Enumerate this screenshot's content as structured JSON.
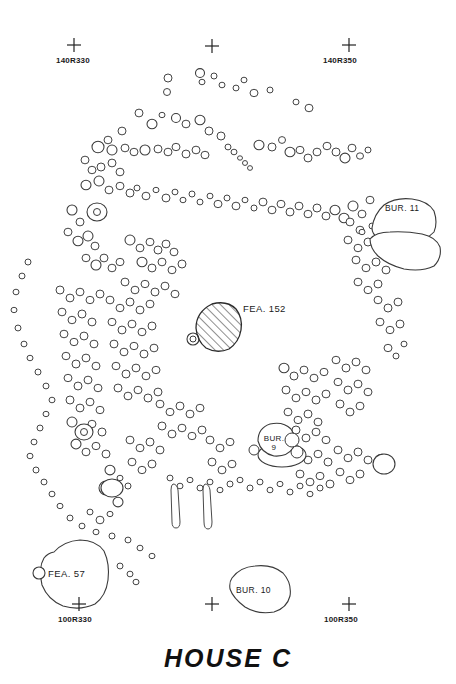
{
  "document": {
    "title": "HOUSE  C",
    "type": "archaeological-plan-map",
    "background_color": "#ffffff",
    "line_color": "#3a3a3a",
    "text_color": "#1a1a1a"
  },
  "grid_markers": [
    {
      "id": "gm-140r330",
      "label": "140R330",
      "x": 74,
      "y": 45,
      "labeled": true
    },
    {
      "id": "gm-140r340",
      "label": "",
      "x": 212,
      "y": 46,
      "labeled": false
    },
    {
      "id": "gm-140r350",
      "label": "140R350",
      "x": 349,
      "y": 45,
      "labeled": true
    },
    {
      "id": "gm-100r330",
      "label": "100R330",
      "x": 79,
      "y": 604,
      "labeled": true
    },
    {
      "id": "gm-100r340",
      "label": "",
      "x": 212,
      "y": 604,
      "labeled": false
    },
    {
      "id": "gm-100r350",
      "label": "100R350",
      "x": 349,
      "y": 604,
      "labeled": true
    }
  ],
  "features": [
    {
      "id": "fea-152",
      "label": "FEA. 152",
      "kind": "hearth-hatched",
      "label_x": 243,
      "label_y": 308
    },
    {
      "id": "bur-11",
      "label": "BUR. 11",
      "kind": "burial",
      "label_x": 385,
      "label_y": 208
    },
    {
      "id": "bur-9",
      "label": "BUR.",
      "label2": "9",
      "kind": "burial",
      "label_x": 262,
      "label_y": 438
    },
    {
      "id": "bur-10",
      "label": "BUR. 10",
      "kind": "burial",
      "label_x": 235,
      "label_y": 596
    },
    {
      "id": "fea-57",
      "label": "FEA. 57",
      "kind": "pit",
      "label_x": 48,
      "label_y": 573
    }
  ],
  "chart_data": {
    "type": "scatter",
    "title": "HOUSE  C",
    "xlabel": "",
    "ylabel": "",
    "postmolds": [
      [
        168,
        78,
        4
      ],
      [
        200,
        73,
        4.5
      ],
      [
        222,
        85,
        3
      ],
      [
        254,
        93,
        4
      ],
      [
        270,
        90,
        3
      ],
      [
        296,
        102,
        3
      ],
      [
        309,
        108,
        4
      ],
      [
        167,
        92,
        3.5
      ],
      [
        139,
        113,
        4
      ],
      [
        152,
        124,
        5
      ],
      [
        162,
        115,
        3
      ],
      [
        176,
        118,
        4.5
      ],
      [
        186,
        124,
        4
      ],
      [
        200,
        120,
        5
      ],
      [
        209,
        131,
        4
      ],
      [
        122,
        131,
        4
      ],
      [
        108,
        140,
        4
      ],
      [
        98,
        147,
        6
      ],
      [
        112,
        150,
        5
      ],
      [
        125,
        148,
        4
      ],
      [
        134,
        152,
        4
      ],
      [
        145,
        150,
        5
      ],
      [
        158,
        149,
        4
      ],
      [
        168,
        152,
        4
      ],
      [
        176,
        147,
        4
      ],
      [
        186,
        154,
        4
      ],
      [
        196,
        150,
        4
      ],
      [
        205,
        155,
        4
      ],
      [
        221,
        136,
        4
      ],
      [
        228,
        147,
        3
      ],
      [
        234,
        152,
        3
      ],
      [
        240,
        158,
        2.5
      ],
      [
        245,
        163,
        2.5
      ],
      [
        250,
        168,
        2.5
      ],
      [
        259,
        145,
        5
      ],
      [
        272,
        147,
        4
      ],
      [
        282,
        140,
        3.5
      ],
      [
        290,
        152,
        5
      ],
      [
        300,
        150,
        4
      ],
      [
        308,
        158,
        4
      ],
      [
        317,
        152,
        4
      ],
      [
        327,
        146,
        4
      ],
      [
        336,
        152,
        4
      ],
      [
        345,
        158,
        5
      ],
      [
        352,
        148,
        4
      ],
      [
        360,
        156,
        3.5
      ],
      [
        368,
        150,
        3
      ],
      [
        85,
        160,
        4
      ],
      [
        92,
        170,
        4
      ],
      [
        101,
        167,
        4
      ],
      [
        112,
        163,
        4
      ],
      [
        120,
        172,
        4
      ],
      [
        86,
        185,
        5
      ],
      [
        99,
        181,
        5
      ],
      [
        109,
        190,
        4
      ],
      [
        120,
        186,
        4
      ],
      [
        130,
        193,
        4
      ],
      [
        137,
        188,
        3
      ],
      [
        146,
        196,
        4
      ],
      [
        156,
        190,
        3
      ],
      [
        166,
        198,
        4
      ],
      [
        175,
        192,
        3
      ],
      [
        183,
        200,
        3
      ],
      [
        192,
        194,
        3
      ],
      [
        200,
        202,
        3
      ],
      [
        210,
        196,
        3
      ],
      [
        218,
        204,
        4
      ],
      [
        227,
        198,
        3
      ],
      [
        236,
        206,
        4
      ],
      [
        245,
        200,
        3
      ],
      [
        254,
        208,
        3
      ],
      [
        263,
        202,
        4
      ],
      [
        272,
        210,
        4
      ],
      [
        281,
        204,
        4
      ],
      [
        290,
        212,
        4
      ],
      [
        299,
        206,
        4
      ],
      [
        308,
        214,
        4
      ],
      [
        317,
        208,
        4
      ],
      [
        326,
        216,
        4
      ],
      [
        335,
        210,
        5
      ],
      [
        344,
        218,
        5
      ],
      [
        353,
        206,
        5
      ],
      [
        362,
        214,
        4
      ],
      [
        370,
        200,
        4
      ],
      [
        72,
        210,
        5
      ],
      [
        80,
        222,
        4
      ],
      [
        68,
        232,
        4
      ],
      [
        78,
        241,
        5
      ],
      [
        88,
        236,
        5
      ],
      [
        95,
        246,
        4
      ],
      [
        86,
        258,
        4
      ],
      [
        96,
        265,
        5
      ],
      [
        104,
        258,
        4
      ],
      [
        112,
        268,
        4
      ],
      [
        120,
        262,
        4
      ],
      [
        130,
        240,
        5
      ],
      [
        140,
        248,
        4
      ],
      [
        150,
        242,
        4
      ],
      [
        158,
        250,
        4
      ],
      [
        166,
        244,
        4
      ],
      [
        174,
        252,
        4
      ],
      [
        142,
        262,
        5
      ],
      [
        152,
        268,
        4
      ],
      [
        162,
        262,
        4
      ],
      [
        172,
        270,
        4
      ],
      [
        182,
        264,
        4
      ],
      [
        125,
        282,
        4
      ],
      [
        135,
        290,
        4
      ],
      [
        145,
        284,
        4
      ],
      [
        155,
        292,
        4
      ],
      [
        165,
        286,
        4
      ],
      [
        175,
        294,
        4
      ],
      [
        28,
        262,
        3
      ],
      [
        22,
        276,
        3
      ],
      [
        16,
        292,
        3
      ],
      [
        14,
        310,
        3
      ],
      [
        18,
        328,
        3
      ],
      [
        24,
        344,
        3
      ],
      [
        30,
        358,
        3
      ],
      [
        38,
        372,
        3
      ],
      [
        46,
        386,
        3
      ],
      [
        52,
        400,
        3
      ],
      [
        46,
        414,
        3
      ],
      [
        40,
        428,
        3
      ],
      [
        34,
        442,
        3
      ],
      [
        30,
        456,
        3
      ],
      [
        36,
        470,
        3
      ],
      [
        44,
        482,
        3
      ],
      [
        52,
        494,
        3
      ],
      [
        60,
        506,
        3
      ],
      [
        70,
        518,
        3
      ],
      [
        82,
        526,
        3
      ],
      [
        96,
        532,
        3
      ],
      [
        112,
        536,
        3
      ],
      [
        128,
        540,
        3
      ],
      [
        140,
        548,
        3
      ],
      [
        152,
        556,
        3
      ],
      [
        120,
        566,
        3
      ],
      [
        130,
        574,
        3
      ],
      [
        136,
        582,
        3
      ],
      [
        60,
        290,
        4
      ],
      [
        70,
        298,
        4
      ],
      [
        80,
        292,
        4
      ],
      [
        90,
        300,
        4
      ],
      [
        100,
        294,
        4
      ],
      [
        62,
        312,
        4
      ],
      [
        72,
        320,
        4
      ],
      [
        82,
        314,
        4
      ],
      [
        92,
        322,
        4
      ],
      [
        64,
        334,
        4
      ],
      [
        74,
        342,
        4
      ],
      [
        84,
        336,
        4
      ],
      [
        94,
        344,
        4
      ],
      [
        66,
        356,
        4
      ],
      [
        76,
        364,
        4
      ],
      [
        86,
        358,
        4
      ],
      [
        96,
        366,
        4
      ],
      [
        68,
        378,
        4
      ],
      [
        78,
        386,
        4
      ],
      [
        88,
        380,
        4
      ],
      [
        98,
        388,
        4
      ],
      [
        70,
        400,
        4
      ],
      [
        80,
        408,
        4
      ],
      [
        90,
        402,
        4
      ],
      [
        100,
        410,
        4
      ],
      [
        72,
        422,
        5
      ],
      [
        82,
        430,
        5
      ],
      [
        92,
        424,
        4
      ],
      [
        102,
        432,
        4
      ],
      [
        76,
        444,
        5
      ],
      [
        86,
        452,
        4
      ],
      [
        96,
        446,
        4
      ],
      [
        106,
        454,
        4
      ],
      [
        110,
        300,
        4
      ],
      [
        120,
        308,
        4
      ],
      [
        130,
        302,
        4
      ],
      [
        140,
        310,
        4
      ],
      [
        150,
        304,
        4
      ],
      [
        112,
        322,
        4
      ],
      [
        122,
        330,
        4
      ],
      [
        132,
        324,
        4
      ],
      [
        142,
        332,
        4
      ],
      [
        152,
        326,
        4
      ],
      [
        114,
        344,
        4
      ],
      [
        124,
        352,
        4
      ],
      [
        134,
        346,
        4
      ],
      [
        144,
        354,
        4
      ],
      [
        154,
        348,
        4
      ],
      [
        116,
        366,
        4
      ],
      [
        126,
        374,
        4
      ],
      [
        136,
        368,
        4
      ],
      [
        146,
        376,
        4
      ],
      [
        156,
        370,
        4
      ],
      [
        118,
        388,
        4
      ],
      [
        128,
        396,
        4
      ],
      [
        138,
        390,
        4
      ],
      [
        148,
        398,
        4
      ],
      [
        158,
        392,
        4
      ],
      [
        160,
        404,
        4
      ],
      [
        170,
        412,
        4
      ],
      [
        180,
        406,
        4
      ],
      [
        190,
        414,
        4
      ],
      [
        200,
        408,
        4
      ],
      [
        162,
        426,
        4
      ],
      [
        172,
        434,
        4
      ],
      [
        182,
        428,
        4
      ],
      [
        192,
        436,
        4
      ],
      [
        202,
        430,
        4
      ],
      [
        130,
        440,
        4
      ],
      [
        140,
        448,
        4
      ],
      [
        150,
        442,
        4
      ],
      [
        160,
        450,
        4
      ],
      [
        132,
        462,
        4
      ],
      [
        142,
        470,
        4
      ],
      [
        152,
        464,
        4
      ],
      [
        110,
        470,
        5
      ],
      [
        120,
        478,
        3
      ],
      [
        128,
        486,
        3
      ],
      [
        210,
        440,
        4
      ],
      [
        220,
        448,
        4
      ],
      [
        230,
        442,
        4
      ],
      [
        212,
        462,
        4
      ],
      [
        222,
        470,
        4
      ],
      [
        232,
        464,
        4
      ],
      [
        296,
        430,
        4
      ],
      [
        306,
        438,
        4
      ],
      [
        316,
        432,
        4
      ],
      [
        326,
        440,
        4
      ],
      [
        298,
        452,
        4
      ],
      [
        308,
        460,
        4
      ],
      [
        318,
        454,
        4
      ],
      [
        328,
        462,
        4
      ],
      [
        300,
        474,
        4
      ],
      [
        310,
        482,
        4
      ],
      [
        320,
        476,
        4
      ],
      [
        330,
        484,
        4
      ],
      [
        338,
        450,
        4
      ],
      [
        348,
        458,
        4
      ],
      [
        358,
        452,
        4
      ],
      [
        368,
        460,
        4
      ],
      [
        340,
        472,
        4
      ],
      [
        350,
        480,
        4
      ],
      [
        360,
        474,
        4
      ],
      [
        382,
        462,
        8
      ],
      [
        284,
        368,
        5
      ],
      [
        294,
        376,
        4
      ],
      [
        304,
        370,
        4
      ],
      [
        314,
        378,
        4
      ],
      [
        324,
        372,
        4
      ],
      [
        286,
        390,
        4
      ],
      [
        296,
        398,
        4
      ],
      [
        306,
        392,
        4
      ],
      [
        316,
        400,
        4
      ],
      [
        326,
        394,
        4
      ],
      [
        288,
        412,
        4
      ],
      [
        298,
        420,
        4
      ],
      [
        308,
        414,
        4
      ],
      [
        318,
        422,
        4
      ],
      [
        336,
        360,
        4
      ],
      [
        346,
        368,
        4
      ],
      [
        356,
        362,
        4
      ],
      [
        366,
        370,
        4
      ],
      [
        338,
        382,
        4
      ],
      [
        348,
        390,
        4
      ],
      [
        358,
        384,
        4
      ],
      [
        368,
        392,
        4
      ],
      [
        340,
        404,
        4
      ],
      [
        350,
        412,
        4
      ],
      [
        360,
        406,
        4
      ],
      [
        388,
        348,
        4
      ],
      [
        396,
        356,
        3
      ],
      [
        404,
        344,
        3
      ],
      [
        378,
        300,
        4
      ],
      [
        388,
        308,
        4
      ],
      [
        398,
        302,
        4
      ],
      [
        380,
        322,
        4
      ],
      [
        390,
        330,
        4
      ],
      [
        400,
        324,
        4
      ],
      [
        356,
        260,
        4
      ],
      [
        366,
        268,
        4
      ],
      [
        376,
        262,
        4
      ],
      [
        386,
        270,
        4
      ],
      [
        358,
        282,
        4
      ],
      [
        368,
        290,
        4
      ],
      [
        378,
        284,
        4
      ],
      [
        348,
        240,
        4
      ],
      [
        358,
        248,
        4
      ],
      [
        368,
        242,
        4
      ],
      [
        350,
        222,
        4
      ],
      [
        360,
        230,
        4
      ],
      [
        410,
        240,
        4
      ],
      [
        418,
        250,
        3
      ],
      [
        404,
        262,
        3
      ],
      [
        240,
        480,
        3
      ],
      [
        250,
        488,
        3
      ],
      [
        260,
        482,
        3
      ],
      [
        270,
        490,
        3
      ],
      [
        280,
        484,
        3
      ],
      [
        290,
        492,
        3
      ],
      [
        300,
        486,
        3
      ],
      [
        310,
        494,
        3
      ],
      [
        320,
        488,
        3
      ],
      [
        170,
        478,
        3
      ],
      [
        180,
        486,
        3
      ],
      [
        190,
        480,
        3
      ],
      [
        200,
        488,
        3
      ],
      [
        210,
        482,
        3
      ],
      [
        220,
        490,
        3
      ],
      [
        230,
        484,
        3
      ],
      [
        90,
        512,
        3
      ],
      [
        100,
        520,
        4
      ],
      [
        110,
        514,
        3
      ],
      [
        106,
        488,
        7
      ],
      [
        118,
        502,
        5
      ],
      [
        202,
        82,
        3
      ],
      [
        214,
        76,
        3
      ],
      [
        236,
        88,
        3
      ],
      [
        244,
        80,
        3
      ],
      [
        362,
        232,
        3
      ],
      [
        372,
        226,
        3
      ]
    ]
  }
}
